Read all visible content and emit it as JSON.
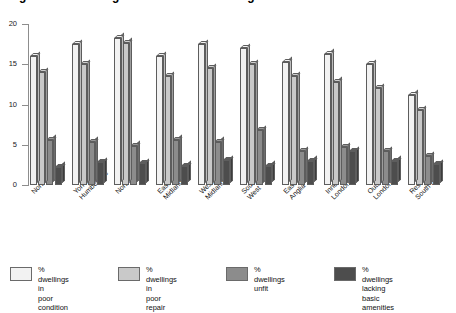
{
  "chart_data": {
    "type": "bar",
    "title": "Figure 1.4  Housing conditions in each region",
    "xlabel": "",
    "ylabel": "",
    "ylim": [
      0,
      20
    ],
    "yticks": [
      0,
      5,
      10,
      15,
      20
    ],
    "grid": false,
    "legend_position": "bottom",
    "categories": [
      "Northern",
      "Yorks &\nHumberside",
      "North West",
      "East\nMidlands",
      "West\nMidlands",
      "South\nWest",
      "East\nAnglia",
      "Inner\nLondon",
      "Outer\nLondon",
      "Rest of\nSouth East"
    ],
    "series": [
      {
        "name": "% dwellings in\npoor condition",
        "color": "#f2f2f2",
        "values": [
          16.0,
          17.5,
          18.3,
          16.0,
          17.5,
          17.0,
          15.3,
          16.3,
          15.0,
          11.2
        ]
      },
      {
        "name": "% dwellings in\npoor repair",
        "color": "#c9c9c9",
        "values": [
          14.0,
          15.0,
          17.7,
          13.5,
          14.5,
          15.0,
          13.5,
          12.8,
          12.0,
          9.3
        ]
      },
      {
        "name": "% dwellings unfit",
        "color": "#8c8c8c",
        "values": [
          5.6,
          5.4,
          4.9,
          5.6,
          5.4,
          6.8,
          4.2,
          4.7,
          4.2,
          3.6
        ]
      },
      {
        "name": "% dwellings lacking\nbasic amenities",
        "color": "#4d4d4d",
        "values": [
          2.3,
          2.8,
          2.7,
          2.4,
          3.1,
          2.4,
          3.0,
          4.2,
          3.0,
          2.6
        ]
      }
    ]
  },
  "legend": {
    "items": [
      {
        "label": "% dwellings in\npoor condition",
        "color": "#f2f2f2"
      },
      {
        "label": "% dwellings in\npoor repair",
        "color": "#c9c9c9"
      },
      {
        "label": "% dwellings unfit",
        "color": "#8c8c8c"
      },
      {
        "label": "% dwellings lacking\nbasic amenities",
        "color": "#4d4d4d"
      }
    ]
  }
}
